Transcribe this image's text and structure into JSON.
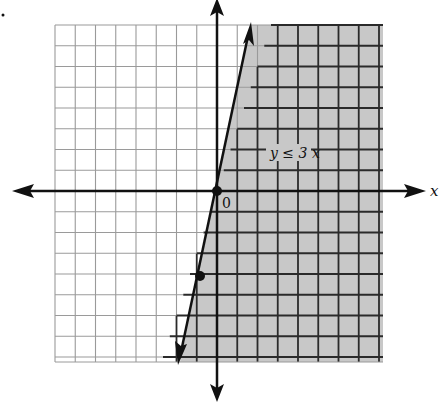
{
  "chart_data": {
    "type": "line",
    "title": "",
    "inequality": "y ≤ 3x",
    "boundary_line": {
      "equation": "y = 3x",
      "style": "solid",
      "slope": 3,
      "intercept": 0
    },
    "shaded_region": "below/right of line (y ≤ 3x)",
    "points": [
      {
        "x": 0,
        "y": 0,
        "label": "0"
      },
      {
        "x": -1,
        "y": -3
      }
    ],
    "xlabel": "x",
    "ylabel": "y",
    "xlim": [
      -8,
      8
    ],
    "ylim": [
      -8,
      8
    ],
    "grid": true,
    "colors": {
      "shade": "#c8c8c8",
      "grid_light": "#9a9a9a",
      "grid_dark": "#2a2a2a",
      "axis": "#111111"
    }
  },
  "labels": {
    "x_axis": "x",
    "origin": "0",
    "inequality": "y ≤ 3 x"
  }
}
